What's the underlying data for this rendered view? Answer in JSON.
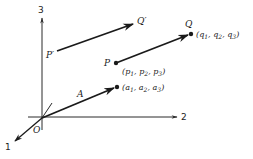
{
  "diagram": {
    "axes": {
      "axis1_label": "1",
      "axis2_label": "2",
      "axis3_label": "3",
      "origin_label": "O"
    },
    "vectors": [
      {
        "name": "A",
        "label": "A",
        "tip_label": "(a",
        "components": [
          "a",
          "a",
          "a"
        ],
        "subscripts": [
          "1",
          "2",
          "3"
        ]
      },
      {
        "name": "PQ",
        "start_label": "P",
        "end_label": "Q",
        "start_components": [
          "p",
          "p",
          "p"
        ],
        "end_components": [
          "q",
          "q",
          "q"
        ],
        "subscripts": [
          "1",
          "2",
          "3"
        ]
      },
      {
        "name": "P'Q'",
        "start_label": "P′",
        "end_label": "Q′"
      }
    ],
    "points": {
      "a_coords": {
        "open": "(",
        "c1": "a",
        "s1": "1",
        "c2": "a",
        "s2": "2",
        "c3": "a",
        "s3": "3",
        "close": ")"
      },
      "p_coords": {
        "open": "(",
        "c1": "p",
        "s1": "1",
        "c2": "p",
        "s2": "2",
        "c3": "p",
        "s3": "3",
        "close": ")"
      },
      "q_coords": {
        "open": "(",
        "c1": "q",
        "s1": "1",
        "c2": "q",
        "s2": "2",
        "c3": "q",
        "s3": "3",
        "close": ")"
      }
    },
    "colors": {
      "ink": "#1a1a1a",
      "background": "#ffffff"
    }
  }
}
